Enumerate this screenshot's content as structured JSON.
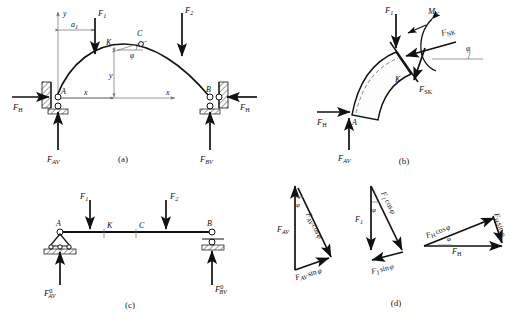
{
  "figure": {
    "panels": [
      {
        "id": "a",
        "caption": "(a)",
        "description": "Arch ABC with supports at A and B, loads F1 and F2, coordinate axes x-y, point K and crown C, tangent angle phi"
      },
      {
        "id": "b",
        "caption": "(b)",
        "description": "Free body of arch segment A-K with internal forces FNK, FSK and moment MK"
      },
      {
        "id": "c",
        "caption": "(c)",
        "description": "Equivalent simply supported beam AB with loads F1 and F2 and reactions"
      },
      {
        "id": "d",
        "caption": "(d)",
        "description": "Force decomposition triangles for FAV, F1 and FH into components along and normal to the tangent"
      }
    ],
    "captions": {
      "a": "(a)",
      "b": "(b)",
      "c": "(c)",
      "d": "(d)"
    }
  },
  "panel_a": {
    "axis_x_label": "x",
    "axis_y_label": "y",
    "dim_a1": "a",
    "dim_a1_sub": "1",
    "coord_x": "x",
    "coord_y": "y",
    "point_A": "A",
    "point_B": "B",
    "point_K": "K",
    "point_C": "C",
    "angle_phi": "φ",
    "load_F1": "F",
    "load_F1_sub": "1",
    "load_F2": "F",
    "load_F2_sub": "2",
    "reaction_FH_left": "F",
    "reaction_FH_left_sub": "H",
    "reaction_FH_right": "F",
    "reaction_FH_right_sub": "H",
    "reaction_FAV": "F",
    "reaction_FAV_sub": "AV",
    "reaction_FBV": "F",
    "reaction_FBV_sub": "BV"
  },
  "panel_b": {
    "load_F1": "F",
    "load_F1_sub": "1",
    "moment_MK": "M",
    "moment_MK_sub": "K",
    "normal_FNK": "F",
    "normal_FNK_sub": "NK",
    "shear_FSK": "F",
    "shear_FSK_sub": "SK",
    "angle_phi": "φ",
    "point_A": "A",
    "point_K": "K",
    "reaction_FH": "F",
    "reaction_FH_sub": "H",
    "reaction_FAV": "F",
    "reaction_FAV_sub": "AV"
  },
  "panel_c": {
    "point_A": "A",
    "point_B": "B",
    "point_K": "K",
    "point_C": "C",
    "load_F1": "F",
    "load_F1_sub": "1",
    "load_F2": "F",
    "load_F2_sub": "2",
    "reaction_A": "F",
    "reaction_A_sub": "AV",
    "reaction_A_sup": "0",
    "reaction_B": "F",
    "reaction_B_sub": "BV",
    "reaction_B_sup": "0"
  },
  "panel_d": {
    "triangle1": {
      "main": "F",
      "main_sub": "AV",
      "component_cos": "F",
      "component_cos_sub": "AV",
      "component_cos_trig": "cos",
      "component_sin": "F",
      "component_sin_sub": "AV",
      "component_sin_trig": "sin",
      "angle": "φ",
      "phi": "φ"
    },
    "triangle2": {
      "main": "F",
      "main_sub": "1",
      "component_cos": "F",
      "component_cos_sub": "1",
      "component_cos_trig": "cos",
      "component_sin": "F",
      "component_sin_sub": "1",
      "component_sin_trig": "sin",
      "angle": "φ",
      "phi": "φ"
    },
    "triangle3": {
      "main": "F",
      "main_sub": "H",
      "component_cos": "F",
      "component_cos_sub": "H",
      "component_cos_trig": "cos",
      "component_sin": "F",
      "component_sin_sub": "H",
      "component_sin_trig": "sin",
      "angle": "φ",
      "phi": "φ"
    }
  },
  "colors": {
    "ink": "#111111",
    "thin_rule": "#6f6f6f",
    "paper": "#ffffff"
  }
}
